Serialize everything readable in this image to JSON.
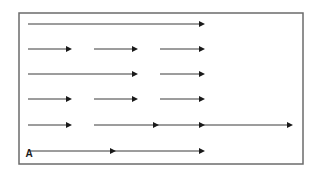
{
  "diagram": {
    "frame": {
      "x": 19,
      "y": 13,
      "width": 284,
      "height": 151,
      "stroke": "#6b6b6b"
    },
    "line_color": "#3a3a3a",
    "arrow_color": "#1a1a1a",
    "label": {
      "text": "A",
      "x": 29,
      "y": 157
    },
    "rows": [
      {
        "y": 24,
        "segments": [
          {
            "x1": 28,
            "x2": 205,
            "heads": [
              205
            ]
          }
        ]
      },
      {
        "y": 49,
        "segments": [
          {
            "x1": 28,
            "x2": 72,
            "heads": [
              72
            ]
          },
          {
            "x1": 94,
            "x2": 138,
            "heads": [
              138
            ]
          },
          {
            "x1": 160,
            "x2": 205,
            "heads": [
              205
            ]
          }
        ]
      },
      {
        "y": 74,
        "segments": [
          {
            "x1": 28,
            "x2": 138,
            "heads": [
              138
            ]
          },
          {
            "x1": 160,
            "x2": 205,
            "heads": [
              205
            ]
          }
        ]
      },
      {
        "y": 99,
        "segments": [
          {
            "x1": 28,
            "x2": 72,
            "heads": [
              72
            ]
          },
          {
            "x1": 94,
            "x2": 138,
            "heads": [
              138
            ]
          },
          {
            "x1": 160,
            "x2": 205,
            "heads": [
              205
            ]
          }
        ]
      },
      {
        "y": 125,
        "segments": [
          {
            "x1": 28,
            "x2": 72,
            "heads": [
              72
            ]
          },
          {
            "x1": 94,
            "x2": 293,
            "heads": [
              159,
              205,
              293
            ]
          }
        ]
      },
      {
        "y": 151,
        "segments": [
          {
            "x1": 30,
            "x2": 205,
            "heads": [
              116,
              205
            ]
          }
        ]
      }
    ]
  }
}
